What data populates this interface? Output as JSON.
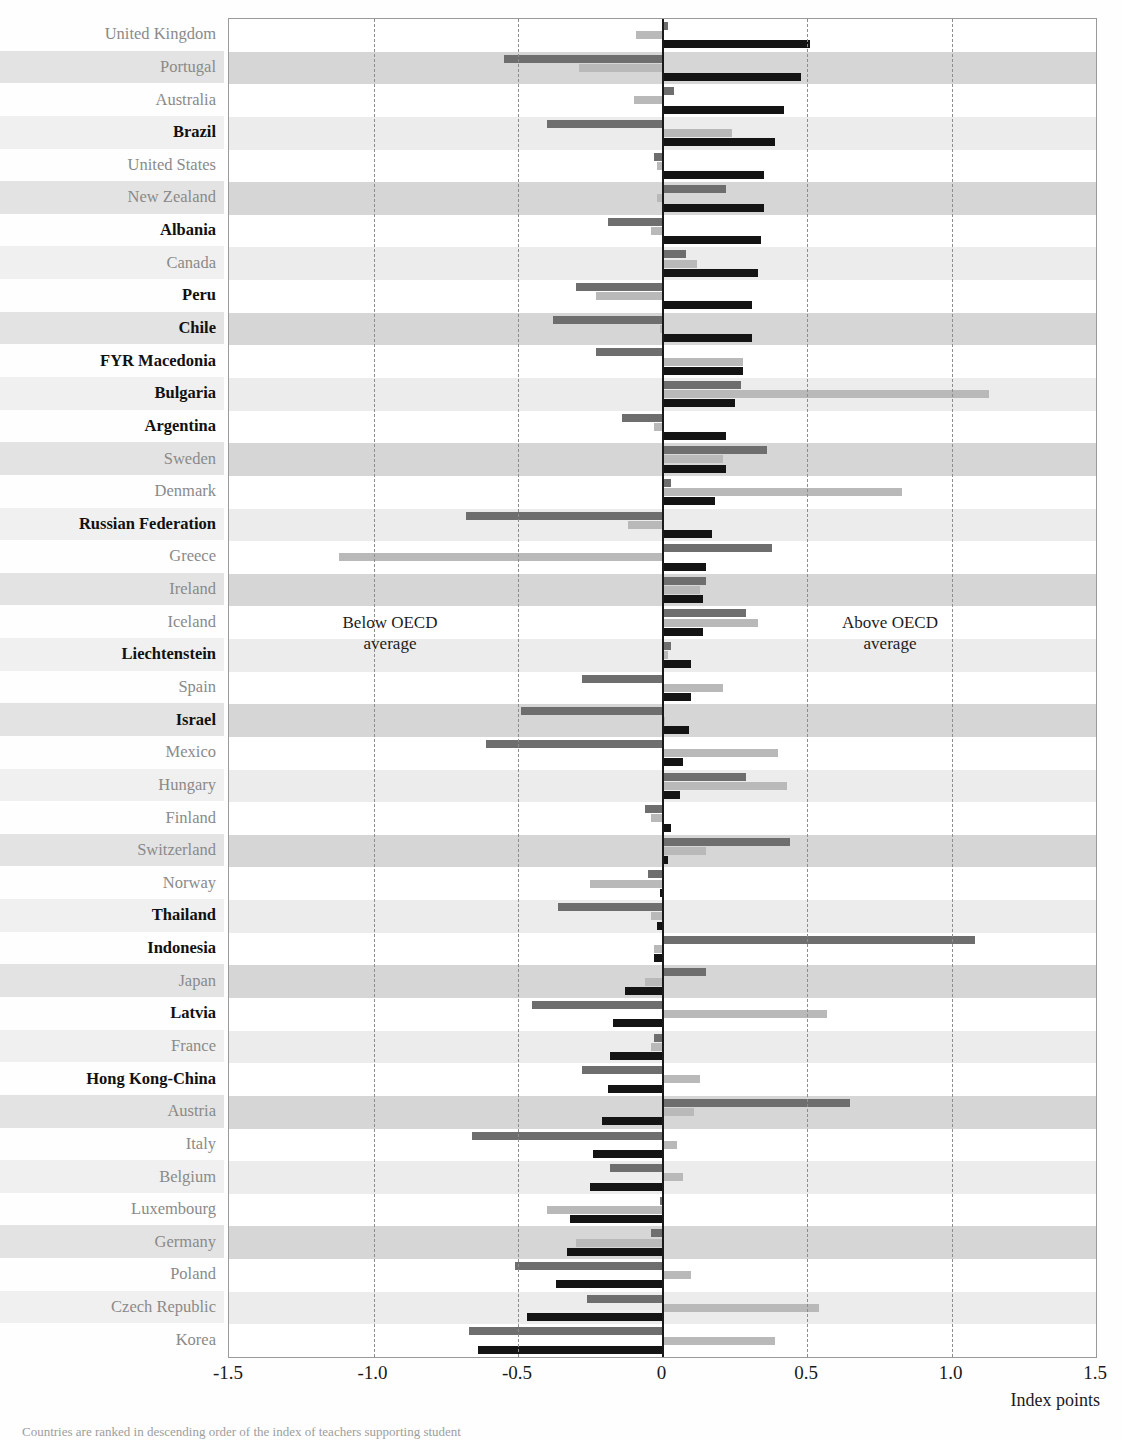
{
  "chart_data": {
    "type": "bar",
    "orientation": "horizontal",
    "title": "",
    "xlabel": "Index points",
    "ylabel": "",
    "xlim": [
      -1.5,
      1.5
    ],
    "xticks": [
      "-1.5",
      "-1.0",
      "-0.5",
      "0",
      "0.5",
      "1.0",
      "1.5"
    ],
    "xtick_values": [
      -1.5,
      -1.0,
      -0.5,
      0,
      0.5,
      1.0,
      1.5
    ],
    "grid": "vertical dashed at -1.0, -0.5, 0.5, 1.0; solid zero line at 0",
    "legend_position": "none",
    "annotations": [
      "Below OECD average",
      "Above OECD average"
    ],
    "series": [
      {
        "name": "series-1",
        "color": "#6e6e6e"
      },
      {
        "name": "series-2",
        "color": "#b9b9b9"
      },
      {
        "name": "series-3",
        "color": "#141414"
      }
    ],
    "categories": [
      "United Kingdom",
      "Portugal",
      "Australia",
      "Brazil",
      "United States",
      "New Zealand",
      "Albania",
      "Canada",
      "Peru",
      "Chile",
      "FYR Macedonia",
      "Bulgaria",
      "Argentina",
      "Sweden",
      "Denmark",
      "Russian Federation",
      "Greece",
      "Ireland",
      "Iceland",
      "Liechtenstein",
      "Spain",
      "Israel",
      "Mexico",
      "Hungary",
      "Finland",
      "Switzerland",
      "Norway",
      "Thailand",
      "Indonesia",
      "Japan",
      "Latvia",
      "France",
      "Hong Kong-China",
      "Austria",
      "Italy",
      "Belgium",
      "Luxembourg",
      "Germany",
      "Poland",
      "Czech Republic",
      "Korea"
    ],
    "rows": [
      {
        "category": "United Kingdom",
        "partner": false,
        "values": [
          0.02,
          -0.09,
          0.51
        ]
      },
      {
        "category": "Portugal",
        "partner": false,
        "values": [
          -0.55,
          -0.29,
          0.48
        ]
      },
      {
        "category": "Australia",
        "partner": false,
        "values": [
          0.04,
          -0.1,
          0.42
        ]
      },
      {
        "category": "Brazil",
        "partner": true,
        "values": [
          -0.4,
          0.24,
          0.39
        ]
      },
      {
        "category": "United States",
        "partner": false,
        "values": [
          -0.03,
          -0.02,
          0.35
        ]
      },
      {
        "category": "New Zealand",
        "partner": false,
        "values": [
          0.22,
          -0.02,
          0.35
        ]
      },
      {
        "category": "Albania",
        "partner": true,
        "values": [
          -0.19,
          -0.04,
          0.34
        ]
      },
      {
        "category": "Canada",
        "partner": false,
        "values": [
          0.08,
          0.12,
          0.33
        ]
      },
      {
        "category": "Peru",
        "partner": true,
        "values": [
          -0.3,
          -0.23,
          0.31
        ]
      },
      {
        "category": "Chile",
        "partner": true,
        "values": [
          -0.38,
          -0.01,
          0.31
        ]
      },
      {
        "category": "FYR Macedonia",
        "partner": true,
        "values": [
          -0.23,
          0.28,
          0.28
        ]
      },
      {
        "category": "Bulgaria",
        "partner": true,
        "values": [
          0.27,
          1.13,
          0.25
        ]
      },
      {
        "category": "Argentina",
        "partner": true,
        "values": [
          -0.14,
          -0.03,
          0.22
        ]
      },
      {
        "category": "Sweden",
        "partner": false,
        "values": [
          0.36,
          0.21,
          0.22
        ]
      },
      {
        "category": "Denmark",
        "partner": false,
        "values": [
          0.03,
          0.83,
          0.18
        ]
      },
      {
        "category": "Russian Federation",
        "partner": true,
        "values": [
          -0.68,
          -0.12,
          0.17
        ]
      },
      {
        "category": "Greece",
        "partner": false,
        "values": [
          0.38,
          -1.12,
          0.15
        ]
      },
      {
        "category": "Ireland",
        "partner": false,
        "values": [
          0.15,
          0.13,
          0.14
        ]
      },
      {
        "category": "Iceland",
        "partner": false,
        "values": [
          0.29,
          0.33,
          0.14
        ]
      },
      {
        "category": "Liechtenstein",
        "partner": true,
        "values": [
          0.03,
          0.02,
          0.1
        ]
      },
      {
        "category": "Spain",
        "partner": false,
        "values": [
          -0.28,
          0.21,
          0.1
        ]
      },
      {
        "category": "Israel",
        "partner": true,
        "values": [
          -0.49,
          0.01,
          0.09
        ]
      },
      {
        "category": "Mexico",
        "partner": false,
        "values": [
          -0.61,
          0.4,
          0.07
        ]
      },
      {
        "category": "Hungary",
        "partner": false,
        "values": [
          0.29,
          0.43,
          0.06
        ]
      },
      {
        "category": "Finland",
        "partner": false,
        "values": [
          -0.06,
          -0.04,
          0.03
        ]
      },
      {
        "category": "Switzerland",
        "partner": false,
        "values": [
          0.44,
          0.15,
          0.02
        ]
      },
      {
        "category": "Norway",
        "partner": false,
        "values": [
          -0.05,
          -0.25,
          -0.01
        ]
      },
      {
        "category": "Thailand",
        "partner": true,
        "values": [
          -0.36,
          -0.04,
          -0.02
        ]
      },
      {
        "category": "Indonesia",
        "partner": true,
        "values": [
          1.08,
          -0.03,
          -0.03
        ]
      },
      {
        "category": "Japan",
        "partner": false,
        "values": [
          0.15,
          -0.06,
          -0.13
        ]
      },
      {
        "category": "Latvia",
        "partner": true,
        "values": [
          -0.45,
          0.57,
          -0.17
        ]
      },
      {
        "category": "France",
        "partner": false,
        "values": [
          -0.03,
          -0.04,
          -0.18
        ]
      },
      {
        "category": "Hong Kong-China",
        "partner": true,
        "values": [
          -0.28,
          0.13,
          -0.19
        ]
      },
      {
        "category": "Austria",
        "partner": false,
        "values": [
          0.65,
          0.11,
          -0.21
        ]
      },
      {
        "category": "Italy",
        "partner": false,
        "values": [
          -0.66,
          0.05,
          -0.24
        ]
      },
      {
        "category": "Belgium",
        "partner": false,
        "values": [
          -0.18,
          0.07,
          -0.25
        ]
      },
      {
        "category": "Luxembourg",
        "partner": false,
        "values": [
          -0.01,
          -0.4,
          -0.32
        ]
      },
      {
        "category": "Germany",
        "partner": false,
        "values": [
          -0.04,
          -0.3,
          -0.33
        ]
      },
      {
        "category": "Poland",
        "partner": false,
        "values": [
          -0.51,
          0.1,
          -0.37
        ]
      },
      {
        "category": "Czech Republic",
        "partner": false,
        "values": [
          -0.26,
          0.54,
          -0.47
        ]
      },
      {
        "category": "Korea",
        "partner": false,
        "values": [
          -0.67,
          0.39,
          -0.64
        ]
      }
    ]
  },
  "axis": {
    "x_title": "Index points"
  },
  "annotations": {
    "below": "Below OECD\naverage",
    "below_line1": "Below OECD",
    "below_line2": "average",
    "above_line1": "Above OECD",
    "above_line2": "average"
  },
  "caption": {
    "text": "Countries are ranked in descending order of the index of teachers supporting student"
  },
  "title_strip": {
    "text": ""
  }
}
